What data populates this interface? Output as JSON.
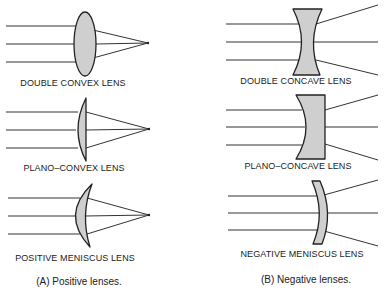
{
  "diagram": {
    "colors": {
      "lens_fill": "#cfcfcf",
      "line": "#222222",
      "background": "#ffffff"
    },
    "positive": {
      "caption": "(A) Positive lenses.",
      "lenses": [
        {
          "label": "DOUBLE CONVEX LENS",
          "type": "double-convex"
        },
        {
          "label": "PLANO–CONVEX LENS",
          "type": "plano-convex"
        },
        {
          "label": "POSITIVE MENISCUS  LENS",
          "type": "positive-meniscus"
        }
      ]
    },
    "negative": {
      "caption": "(B) Negative lenses.",
      "lenses": [
        {
          "label": "DOUBLE CONCAVE LENS",
          "type": "double-concave"
        },
        {
          "label": "PLANO–CONCAVE LENS",
          "type": "plano-concave"
        },
        {
          "label": "NEGATIVE MENISCUS LENS",
          "type": "negative-meniscus"
        }
      ]
    }
  }
}
